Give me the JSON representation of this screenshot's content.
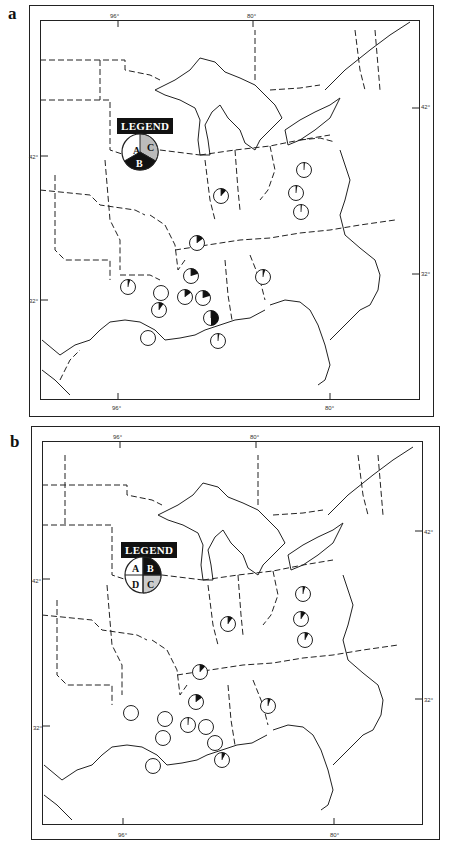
{
  "panels": [
    {
      "label": "a",
      "ticks": {
        "top_left": "96°",
        "top_right": "80°",
        "bottom_left": "96°",
        "bottom_right": "80°",
        "left_42": "42°",
        "left_32": "32°",
        "right_42": "42°",
        "right_32": "32°"
      },
      "legend": {
        "title": "LEGEND",
        "segments": [
          {
            "label": "A",
            "fill": "#ffffff"
          },
          {
            "label": "B",
            "fill": "#111111"
          },
          {
            "label": "C",
            "fill": "#bbbbbb"
          }
        ]
      },
      "pies": [
        {
          "x": 221,
          "y": 196,
          "black_fraction": 0.12
        },
        {
          "x": 304,
          "y": 170,
          "black_fraction": 0.02
        },
        {
          "x": 296,
          "y": 193,
          "black_fraction": 0.03
        },
        {
          "x": 301,
          "y": 212,
          "black_fraction": 0.02
        },
        {
          "x": 197,
          "y": 243,
          "black_fraction": 0.15
        },
        {
          "x": 191,
          "y": 276,
          "black_fraction": 0.2
        },
        {
          "x": 263,
          "y": 277,
          "black_fraction": 0.05
        },
        {
          "x": 128,
          "y": 287,
          "black_fraction": 0.05
        },
        {
          "x": 161,
          "y": 293,
          "black_fraction": 0
        },
        {
          "x": 185,
          "y": 297,
          "black_fraction": 0.15
        },
        {
          "x": 203,
          "y": 298,
          "black_fraction": 0.2
        },
        {
          "x": 159,
          "y": 310,
          "black_fraction": 0.1
        },
        {
          "x": 211,
          "y": 318,
          "black_fraction": 0.5
        },
        {
          "x": 218,
          "y": 341,
          "black_fraction": 0.03
        },
        {
          "x": 148,
          "y": 338,
          "black_fraction": 0
        }
      ]
    },
    {
      "label": "b",
      "ticks": {
        "top_left": "96°",
        "top_right": "80°",
        "bottom_left": "96°",
        "bottom_right": "80°",
        "left_42": "42°",
        "left_32": "32°",
        "right_42": "42°",
        "right_32": "32°"
      },
      "legend": {
        "title": "LEGEND",
        "segments": [
          {
            "label": "A",
            "fill": "#ffffff"
          },
          {
            "label": "B",
            "fill": "#111111"
          },
          {
            "label": "C",
            "fill": "#bbbbbb"
          },
          {
            "label": "D",
            "fill": "#ffffff"
          }
        ]
      },
      "pies": [
        {
          "x": 228,
          "y": 624,
          "black_fraction": 0.1
        },
        {
          "x": 303,
          "y": 594,
          "black_fraction": 0.05
        },
        {
          "x": 301,
          "y": 619,
          "black_fraction": 0.1
        },
        {
          "x": 305,
          "y": 640,
          "black_fraction": 0.08
        },
        {
          "x": 200,
          "y": 672,
          "black_fraction": 0.12
        },
        {
          "x": 196,
          "y": 702,
          "black_fraction": 0.15
        },
        {
          "x": 268,
          "y": 706,
          "black_fraction": 0.06
        },
        {
          "x": 131,
          "y": 713,
          "black_fraction": 0
        },
        {
          "x": 165,
          "y": 719,
          "black_fraction": 0
        },
        {
          "x": 188,
          "y": 725,
          "black_fraction": 0.02
        },
        {
          "x": 206,
          "y": 727,
          "black_fraction": 0
        },
        {
          "x": 163,
          "y": 738,
          "black_fraction": 0
        },
        {
          "x": 215,
          "y": 743,
          "black_fraction": 0
        },
        {
          "x": 222,
          "y": 760,
          "black_fraction": 0.08
        },
        {
          "x": 153,
          "y": 766,
          "black_fraction": 0
        }
      ]
    }
  ]
}
